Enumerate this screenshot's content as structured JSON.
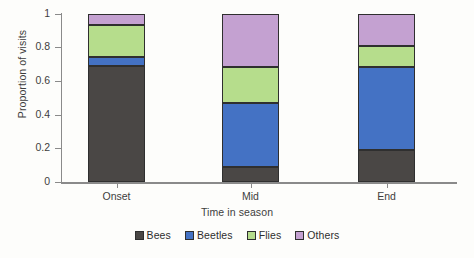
{
  "chart_data": {
    "type": "bar",
    "subtype": "stacked-bar",
    "title": "",
    "xlabel": "Time in season",
    "ylabel": "Proportion of visits",
    "categories": [
      "Onset",
      "Mid",
      "End"
    ],
    "series": [
      {
        "name": "Bees",
        "color": "#4a4745",
        "values": [
          0.69,
          0.09,
          0.19
        ]
      },
      {
        "name": "Beetles",
        "color": "#4472c4",
        "values": [
          0.05,
          0.38,
          0.49
        ]
      },
      {
        "name": "Flies",
        "color": "#b6dd8c",
        "values": [
          0.19,
          0.21,
          0.13
        ]
      },
      {
        "name": "Others",
        "color": "#c4a1d1",
        "values": [
          0.07,
          0.32,
          0.19
        ]
      }
    ],
    "ylim": [
      0,
      1
    ],
    "yticks": [
      0,
      0.2,
      0.4,
      0.6,
      0.8,
      1
    ],
    "ytick_labels": [
      "0",
      "0.2",
      "0.4",
      "0.6",
      "0.8",
      "1"
    ],
    "grid": false,
    "legend_position": "bottom",
    "legend_entries": [
      "Bees",
      "Beetles",
      "Flies",
      "Others"
    ],
    "stacked_total": 1
  }
}
